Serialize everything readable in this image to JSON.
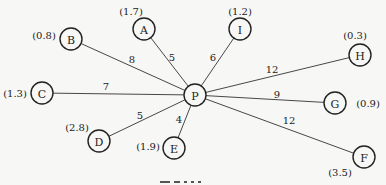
{
  "diagram": {
    "type": "star-graph",
    "center_node": "P",
    "nodes": [
      {
        "id": "P",
        "label": "P",
        "x": 195,
        "y": 95,
        "value": null
      },
      {
        "id": "A",
        "label": "A",
        "x": 144,
        "y": 29,
        "value": "(1.7)",
        "vx": 131,
        "vy": 11
      },
      {
        "id": "I",
        "label": "I",
        "x": 240,
        "y": 29,
        "value": "(1.2)",
        "vx": 240,
        "vy": 11
      },
      {
        "id": "B",
        "label": "B",
        "x": 71,
        "y": 39,
        "value": "(0.8)",
        "vx": 44,
        "vy": 35
      },
      {
        "id": "C",
        "label": "C",
        "x": 42,
        "y": 93,
        "value": "(1.3)",
        "vx": 15,
        "vy": 93
      },
      {
        "id": "D",
        "label": "D",
        "x": 99,
        "y": 141,
        "value": "(2.8)",
        "vx": 77,
        "vy": 127
      },
      {
        "id": "E",
        "label": "E",
        "x": 174,
        "y": 148,
        "value": "(1.9)",
        "vx": 148,
        "vy": 146
      },
      {
        "id": "H",
        "label": "H",
        "x": 360,
        "y": 55,
        "value": "(0.3)",
        "vx": 355,
        "vy": 35
      },
      {
        "id": "G",
        "label": "G",
        "x": 335,
        "y": 103,
        "value": "(0.9)",
        "vx": 368,
        "vy": 103
      },
      {
        "id": "F",
        "label": "F",
        "x": 364,
        "y": 157,
        "value": "(3.5)",
        "vx": 340,
        "vy": 172
      }
    ],
    "edges": [
      {
        "from": "P",
        "to": "A",
        "weight": "5",
        "lx": 172,
        "ly": 57
      },
      {
        "from": "P",
        "to": "I",
        "weight": "6",
        "lx": 213,
        "ly": 57
      },
      {
        "from": "P",
        "to": "B",
        "weight": "8",
        "lx": 132,
        "ly": 59
      },
      {
        "from": "P",
        "to": "C",
        "weight": "7",
        "lx": 106,
        "ly": 86
      },
      {
        "from": "P",
        "to": "D",
        "weight": "5",
        "lx": 140,
        "ly": 115
      },
      {
        "from": "P",
        "to": "E",
        "weight": "4",
        "lx": 179,
        "ly": 119
      },
      {
        "from": "P",
        "to": "H",
        "weight": "12",
        "lx": 272,
        "ly": 69
      },
      {
        "from": "P",
        "to": "G",
        "weight": "9",
        "lx": 277,
        "ly": 94
      },
      {
        "from": "P",
        "to": "F",
        "weight": "12",
        "lx": 289,
        "ly": 120
      }
    ]
  },
  "caption": {
    "truncated": true
  }
}
